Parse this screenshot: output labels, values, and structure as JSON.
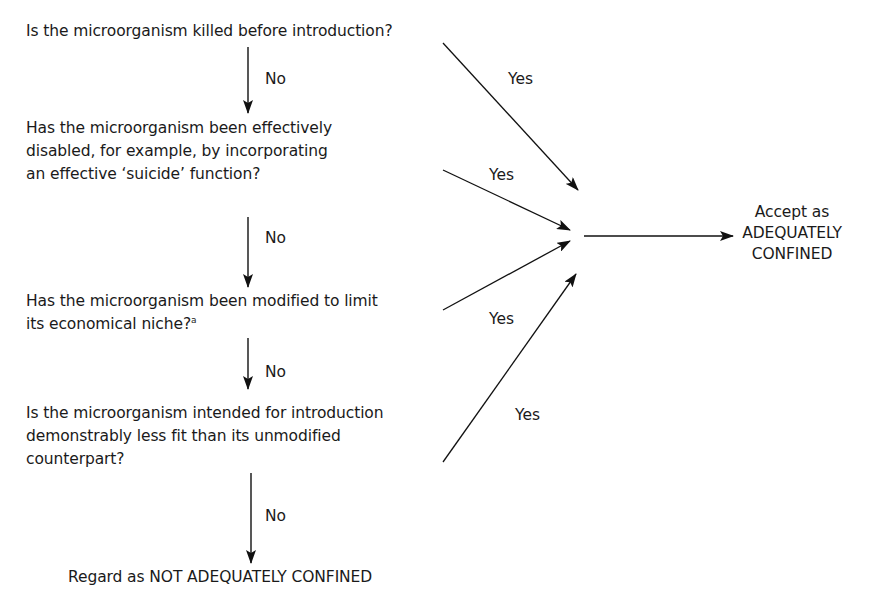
{
  "diagram": {
    "questions": [
      {
        "id": "q1",
        "lines": [
          "Is the microorganism killed before introduction?"
        ]
      },
      {
        "id": "q2",
        "lines": [
          "Has the microorganism been effectively",
          "disabled, for example, by incorporating",
          "an effective ‘suicide’ function?"
        ]
      },
      {
        "id": "q3",
        "lines": [
          "Has the microorganism been modified to limit",
          "its economical niche?"
        ],
        "footnote_marker": "a"
      },
      {
        "id": "q4",
        "lines": [
          "Is the microorganism intended for introduction",
          "demonstrably less fit than its unmodified",
          "counterpart?"
        ]
      }
    ],
    "edge_labels": {
      "no_1": "No",
      "no_2": "No",
      "no_3": "No",
      "no_4": "No",
      "yes_1": "Yes",
      "yes_2": "Yes",
      "yes_3": "Yes",
      "yes_4": "Yes"
    },
    "outcomes": {
      "accept": [
        "Accept as",
        "ADEQUATELY",
        "CONFINED"
      ],
      "reject": "Regard as NOT ADEQUATELY CONFINED"
    }
  }
}
